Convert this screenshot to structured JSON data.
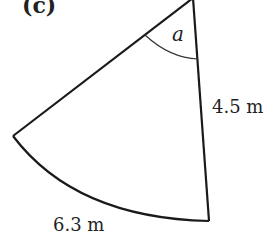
{
  "figure": {
    "part_label": "(c)",
    "shape": "sector",
    "angle_label": "a",
    "radius_label": "4.5 m",
    "arc_length_label": "6.3 m",
    "colors": {
      "stroke": "#1a1a1a",
      "text": "#222222",
      "background": "#ffffff"
    }
  }
}
